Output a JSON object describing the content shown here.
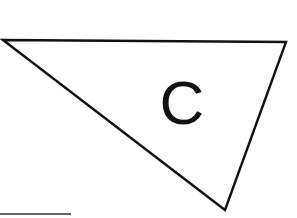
{
  "canvas": {
    "width": 297,
    "height": 218,
    "background": "#ffffff"
  },
  "triangle": {
    "label": "C",
    "points": "3,40 286,42 225,210",
    "stroke": "#111111",
    "stroke_width": 2.4,
    "fill": "#ffffff"
  },
  "label_position": {
    "x": "182",
    "y": "124"
  },
  "baseline_segment": {
    "x1": "0",
    "y1": "214",
    "x2": "71",
    "y2": "214",
    "stroke": "#333333"
  }
}
